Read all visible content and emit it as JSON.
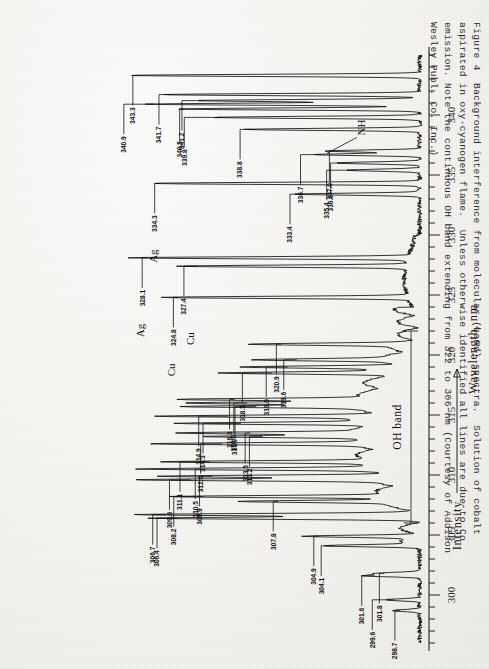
{
  "figure": {
    "number": "Figure 4",
    "caption_lines": [
      "Figure 4  Background interference from molecular (band) spectra.  Solution of cobalt",
      "aspirated in oxy-cyanogen flame.  Unless otherwise identified all lines are due to Co",
      "emission. Note the continuous OH band extending from 322 to 306 nm (Courtesy of Addison",
      "Wesley Publ. Co. Inc.)"
    ],
    "caption_text": "Figure 4  Background interference from molecular (band) spectra.  Solution of cobalt\naspirated in oxy-cyanogen flame.  Unless otherwise identified all lines are due to Co\nemission. Note the continuous OH band extending from 322 to 306 nm (Courtesy of Addison\nWesley Publ. Co. Inc.)"
  },
  "annotations": {
    "nh_label": "NH",
    "oh_band_label": "OH band",
    "ag_label_1": "Ag",
    "ag_label_2": "Ag",
    "cu_label_1": "Cu",
    "cu_label_2": "Cu"
  },
  "colors": {
    "ink": "#111111",
    "paper": "#f4f3f0",
    "caption_ink": "#2f2e2c"
  },
  "chart_data": {
    "type": "line",
    "title": "",
    "xlabel": "Wavelength, nm",
    "ylabel": "Intensity",
    "xlim": [
      296,
      345
    ],
    "ylim": [
      0,
      100
    ],
    "grid": false,
    "legend": "none",
    "orientation": "x-axis drawn vertically; figure printed rotated 180 degrees",
    "x_ticks_major": [
      300,
      305,
      310,
      315,
      320,
      325,
      330,
      335,
      340
    ],
    "x_tick_labels": [
      "300",
      "305",
      "310",
      "315",
      "320",
      "325",
      "330",
      "335",
      "340"
    ],
    "x_tick_minor_step": 1,
    "y_axis_arrow_direction": "increasing",
    "peaks": [
      {
        "wavelength": 343.3,
        "label": "343.3",
        "height": 93,
        "element": ""
      },
      {
        "wavelength": 341.7,
        "label": "341.7",
        "height": 82,
        "element": ""
      },
      {
        "wavelength": 341.2,
        "label": "341.2",
        "height": 72,
        "element": ""
      },
      {
        "wavelength": 340.9,
        "label": "340.9",
        "height": 88,
        "element": ""
      },
      {
        "wavelength": 340.5,
        "label": "340.5",
        "height": 78,
        "element": ""
      },
      {
        "wavelength": 339.8,
        "label": "339.8",
        "height": 66,
        "element": ""
      },
      {
        "wavelength": 338.8,
        "label": "338.8",
        "height": 56,
        "element": ""
      },
      {
        "wavelength": 337.0,
        "label": "337.0",
        "height": 30,
        "element": ""
      },
      {
        "wavelength": 336.7,
        "label": "336.7",
        "height": 34,
        "element": ""
      },
      {
        "wavelength": 336.0,
        "label": "336.0",
        "height": 27,
        "element": ""
      },
      {
        "wavelength": 335.4,
        "label": "335.4",
        "height": 23,
        "element": ""
      },
      {
        "wavelength": 334.3,
        "label": "334.3",
        "height": 86,
        "element": "Ag"
      },
      {
        "wavelength": 333.4,
        "label": "333.4",
        "height": 40,
        "element": ""
      },
      {
        "wavelength": 328.1,
        "label": "328.1",
        "height": 90,
        "element": "Ag"
      },
      {
        "wavelength": 327.4,
        "label": "327.4",
        "height": 74,
        "element": "Cu"
      },
      {
        "wavelength": 324.8,
        "label": "324.8",
        "height": 80,
        "element": "Cu"
      },
      {
        "wavelength": 320.9,
        "label": "320.9",
        "height": 47,
        "element": ""
      },
      {
        "wavelength": 319.6,
        "label": "319.6",
        "height": 42,
        "element": ""
      },
      {
        "wavelength": 319.0,
        "label": "319.0",
        "height": 45,
        "element": ""
      },
      {
        "wavelength": 318.5,
        "label": "318.5",
        "height": 50,
        "element": ""
      },
      {
        "wavelength": 316.3,
        "label": "316.3",
        "height": 62,
        "element": ""
      },
      {
        "wavelength": 316.0,
        "label": "316.0",
        "height": 58,
        "element": ""
      },
      {
        "wavelength": 315.7,
        "label": "315.7",
        "height": 55,
        "element": ""
      },
      {
        "wavelength": 314.9,
        "label": "314.9",
        "height": 64,
        "element": ""
      },
      {
        "wavelength": 314.3,
        "label": "314.3",
        "height": 60,
        "element": ""
      },
      {
        "wavelength": 313.5,
        "label": "313.5",
        "height": 57,
        "element": ""
      },
      {
        "wavelength": 313.2,
        "label": "313.2",
        "height": 53,
        "element": ""
      },
      {
        "wavelength": 312.6,
        "label": "312.6",
        "height": 66,
        "element": ""
      },
      {
        "wavelength": 311.1,
        "label": "311.1",
        "height": 70,
        "element": ""
      },
      {
        "wavelength": 310.5,
        "label": "310.5",
        "height": 73,
        "element": ""
      },
      {
        "wavelength": 309.9,
        "label": "309.9",
        "height": 69,
        "element": ""
      },
      {
        "wavelength": 309.6,
        "label": "309.6",
        "height": 76,
        "element": ""
      },
      {
        "wavelength": 308.2,
        "label": "308.2",
        "height": 72,
        "element": ""
      },
      {
        "wavelength": 307.8,
        "label": "307.8",
        "height": 48,
        "element": ""
      },
      {
        "wavelength": 306.7,
        "label": "306.7",
        "height": 84,
        "element": ""
      },
      {
        "wavelength": 306.4,
        "label": "306.4",
        "height": 80,
        "element": ""
      },
      {
        "wavelength": 304.9,
        "label": "304.9",
        "height": 35,
        "element": ""
      },
      {
        "wavelength": 304.1,
        "label": "304.1",
        "height": 30,
        "element": ""
      },
      {
        "wavelength": 301.8,
        "label": "301.8",
        "height": 14,
        "element": ""
      },
      {
        "wavelength": 301.6,
        "label": "301.6",
        "height": 17,
        "element": ""
      },
      {
        "wavelength": 299.6,
        "label": "299.6",
        "height": 11,
        "element": ""
      },
      {
        "wavelength": 298.7,
        "label": "298.7",
        "height": 9,
        "element": ""
      }
    ],
    "bands": [
      {
        "name": "OH band",
        "from": 306,
        "to": 322
      }
    ]
  }
}
